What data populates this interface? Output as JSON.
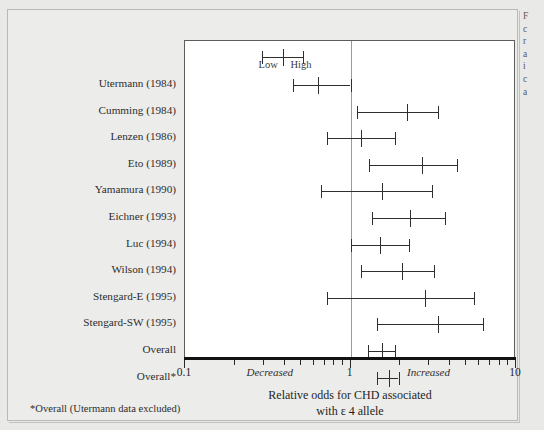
{
  "figure": {
    "panel_background": "#ececeb",
    "page_background": "#e9e9e7",
    "plot_background": "#ffffff"
  },
  "caption_fragment_lines": [
    "F",
    "c",
    "r",
    "a",
    "i",
    "c",
    "a"
  ],
  "legend": {
    "low_label": "Low",
    "high_label": "High",
    "low_value": 0.29,
    "high_value": 0.52,
    "point_value": 0.39
  },
  "axis": {
    "title_line1": "Relative odds for CHD associated",
    "title_line2": "with ε 4 allele",
    "scale": "log",
    "min": 0.1,
    "max": 10,
    "reference_value": 1,
    "tick_labels": [
      {
        "value": 0.1,
        "label": "0.1"
      },
      {
        "value": 1,
        "label": "1"
      },
      {
        "value": 10,
        "label": "10"
      }
    ],
    "minor_ticks": [
      0.2,
      0.3,
      0.4,
      0.5,
      0.6,
      0.7,
      0.8,
      0.9,
      2,
      3,
      4,
      5,
      6,
      7,
      8,
      9
    ],
    "direction_left": "Decreased",
    "direction_right": "Increased",
    "direction_left_value": 0.33,
    "direction_right_value": 3.0
  },
  "footnote": "*Overall (Utermann data excluded)",
  "chart_data": {
    "type": "forest",
    "title": "Relative odds for CHD associated with ε 4 allele",
    "xlabel": "Relative odds for CHD associated with ε 4 allele",
    "ylabel": "",
    "xscale": "log",
    "xlim": [
      0.1,
      10
    ],
    "reference_line": 1,
    "grid": false,
    "legend_position": "top-inside",
    "categories": [
      "Utermann (1984)",
      "Cumming (1984)",
      "Lenzen (1986)",
      "Eto (1989)",
      "Yamamura (1990)",
      "Eichner (1993)",
      "Luc (1994)",
      "Wilson (1994)",
      "Stengard-E (1995)",
      "Stengard-SW (1995)",
      "Overall",
      "Overall*"
    ],
    "points": [
      {
        "study": "Utermann (1984)",
        "odds": 0.64,
        "ci_low": 0.45,
        "ci_high": 1.0
      },
      {
        "study": "Cumming (1984)",
        "odds": 2.2,
        "ci_low": 1.1,
        "ci_high": 3.4
      },
      {
        "study": "Lenzen (1986)",
        "odds": 1.15,
        "ci_low": 0.72,
        "ci_high": 1.85
      },
      {
        "study": "Eto (1989)",
        "odds": 2.7,
        "ci_low": 1.3,
        "ci_high": 4.4
      },
      {
        "study": "Yamamura (1990)",
        "odds": 1.55,
        "ci_low": 0.66,
        "ci_high": 3.1
      },
      {
        "study": "Eichner (1993)",
        "odds": 2.3,
        "ci_low": 1.35,
        "ci_high": 3.7
      },
      {
        "study": "Luc (1994)",
        "odds": 1.5,
        "ci_low": 1.0,
        "ci_high": 2.25
      },
      {
        "study": "Wilson (1994)",
        "odds": 2.05,
        "ci_low": 1.15,
        "ci_high": 3.2
      },
      {
        "study": "Stengard-E (1995)",
        "odds": 2.8,
        "ci_low": 0.72,
        "ci_high": 5.6
      },
      {
        "study": "Stengard-SW (1995)",
        "odds": 3.4,
        "ci_low": 1.45,
        "ci_high": 6.3
      },
      {
        "study": "Overall",
        "odds": 1.55,
        "ci_low": 1.28,
        "ci_high": 1.85
      },
      {
        "study": "Overall*",
        "odds": 1.7,
        "ci_low": 1.45,
        "ci_high": 1.95
      }
    ]
  }
}
